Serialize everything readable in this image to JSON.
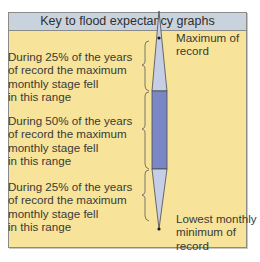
{
  "key": {
    "title": "Key to flood expectancy graphs",
    "descriptions": [
      {
        "line1": "During 25% of the years",
        "line2": "of record the maximum",
        "line3": "monthly stage fell",
        "line4": "in this range"
      },
      {
        "line1": "During 50% of the years",
        "line2": "of record the maximum",
        "line3": "monthly stage fell",
        "line4": "in this range"
      },
      {
        "line1": "During 25% of the years",
        "line2": "of record the maximum",
        "line3": "monthly stage fell",
        "line4": "in this range"
      }
    ],
    "labels": {
      "top_line1": "Maximum of",
      "top_line2": "record",
      "bottom_line1": "Lowest monthly",
      "bottom_line2": "minimum of",
      "bottom_line3": "record"
    },
    "colors": {
      "background": "#f7e39a",
      "header": "#c9d3dd",
      "middle_bar": "#7b87c4",
      "outer_wedges": "#c6cde6",
      "outline": "#4a4a4a"
    }
  }
}
